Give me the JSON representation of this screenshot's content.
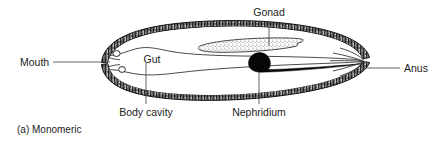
{
  "figure": {
    "caption": "(a)  Monomeric",
    "caption_marker": "(a)",
    "caption_title": "Monomeric",
    "background_color": "#ffffff",
    "ink_color": "#111111",
    "label_color": "#1c1c1c",
    "width": 445,
    "height": 141
  },
  "labels": {
    "mouth": "Mouth",
    "gut": "Gut",
    "gonad": "Gonad",
    "anus": "Anus",
    "body_cavity": "Body cavity",
    "nephridium": "Nephridium"
  },
  "structures": [
    {
      "id": "body-wall",
      "name": "body-wall",
      "label": "",
      "fill_style": "stippled-hatched-band",
      "color": "#111111"
    },
    {
      "id": "body-cavity",
      "name": "body-cavity",
      "label": "Body cavity",
      "fill_style": "empty-white",
      "color": "#ffffff"
    },
    {
      "id": "gut",
      "name": "gut",
      "label": "Gut",
      "fill_style": "outline-tube",
      "color": "#2a2a2a"
    },
    {
      "id": "gonad",
      "name": "gonad",
      "label": "Gonad",
      "fill_style": "stippled",
      "color": "#d8d8d8"
    },
    {
      "id": "nephridium",
      "name": "nephridium",
      "label": "Nephridium",
      "fill_style": "solid-black",
      "color": "#070707"
    },
    {
      "id": "mouth",
      "name": "mouth",
      "label": "Mouth",
      "fill_style": "opening",
      "color": "#ffffff"
    },
    {
      "id": "anus",
      "name": "anus",
      "label": "Anus",
      "fill_style": "opening",
      "color": "#ffffff"
    }
  ]
}
